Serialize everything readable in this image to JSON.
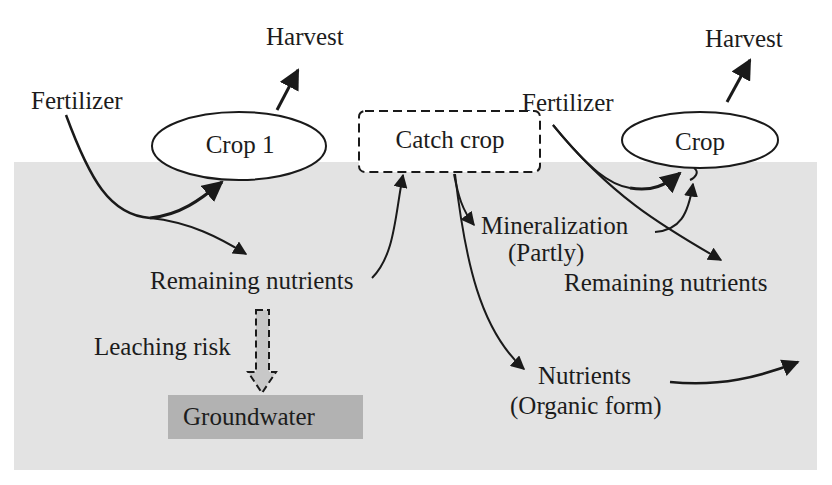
{
  "diagram": {
    "colors": {
      "background": "#ffffff",
      "soil": "#e3e3e3",
      "groundwater": "#b2b2b2",
      "stroke": "#1a1a1a"
    },
    "left_system": {
      "fertilizer": "Fertilizer",
      "crop": "Crop 1",
      "harvest": "Harvest",
      "remaining_nutrients": "Remaining nutrients",
      "leaching_risk": "Leaching risk",
      "groundwater": "Groundwater"
    },
    "catch_crop": {
      "label": "Catch crop",
      "mineralization": "Mineralization",
      "mineralization_note": "(Partly)",
      "nutrients": "Nutrients",
      "nutrients_note": "(Organic form)"
    },
    "right_system": {
      "fertilizer": "Fertilizer",
      "crop": "Crop",
      "harvest": "Harvest",
      "remaining_nutrients": "Remaining nutrients"
    },
    "nodes": [
      {
        "id": "fertilizer-1",
        "label": "Fertilizer"
      },
      {
        "id": "crop-1",
        "label": "Crop 1",
        "shape": "ellipse"
      },
      {
        "id": "harvest-1",
        "label": "Harvest"
      },
      {
        "id": "remaining-1",
        "label": "Remaining nutrients"
      },
      {
        "id": "groundwater",
        "label": "Groundwater",
        "shape": "rect"
      },
      {
        "id": "catch-crop",
        "label": "Catch crop",
        "shape": "dashed-rect"
      },
      {
        "id": "mineralization",
        "label": "Mineralization (Partly)"
      },
      {
        "id": "organic-nutrients",
        "label": "Nutrients (Organic form)"
      },
      {
        "id": "fertilizer-2",
        "label": "Fertilizer"
      },
      {
        "id": "crop-2",
        "label": "Crop",
        "shape": "ellipse"
      },
      {
        "id": "harvest-2",
        "label": "Harvest"
      },
      {
        "id": "remaining-2",
        "label": "Remaining nutrients"
      }
    ],
    "edges": [
      {
        "from": "fertilizer-1",
        "to": "crop-1"
      },
      {
        "from": "fertilizer-1",
        "to": "remaining-1"
      },
      {
        "from": "crop-1",
        "to": "harvest-1"
      },
      {
        "from": "remaining-1",
        "to": "catch-crop"
      },
      {
        "from": "remaining-1",
        "to": "groundwater",
        "style": "dashed",
        "label": "Leaching risk"
      },
      {
        "from": "catch-crop",
        "to": "mineralization"
      },
      {
        "from": "catch-crop",
        "to": "organic-nutrients"
      },
      {
        "from": "mineralization",
        "to": "crop-2"
      },
      {
        "from": "fertilizer-2",
        "to": "crop-2"
      },
      {
        "from": "fertilizer-2",
        "to": "remaining-2"
      },
      {
        "from": "crop-2",
        "to": "harvest-2"
      },
      {
        "from": "organic-nutrients",
        "to": "out-right"
      }
    ]
  }
}
